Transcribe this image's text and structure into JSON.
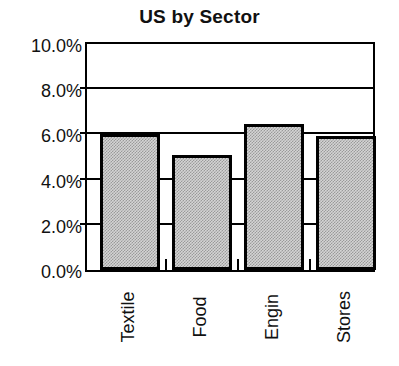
{
  "chart_data": {
    "type": "bar",
    "title": "US by Sector",
    "xlabel": "",
    "ylabel": "",
    "categories": [
      "Textile",
      "Food",
      "Engin",
      "Stores"
    ],
    "values": [
      6.0,
      5.1,
      6.45,
      5.95
    ],
    "value_unit": "%",
    "ylim": [
      0.0,
      10.0
    ],
    "ytick_values": [
      0.0,
      2.0,
      4.0,
      6.0,
      8.0,
      10.0
    ],
    "ytick_labels": [
      "0.0%",
      "2.0%",
      "4.0%",
      "6.0%",
      "8.0%",
      "10.0%"
    ],
    "grid": true,
    "grid_axis": "y",
    "legend": false,
    "legend_position": "none",
    "series": [
      {
        "name": "US by Sector",
        "values": [
          6.0,
          5.1,
          6.45,
          5.95
        ]
      }
    ],
    "colors": {
      "bar_fill": "#d4d4d4",
      "bar_pattern": "#9a9a9a",
      "bar_border": "#000000",
      "axis": "#000000",
      "grid": "#000000",
      "text": "#111111",
      "background": "#ffffff"
    }
  }
}
